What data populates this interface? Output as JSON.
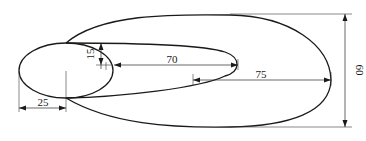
{
  "diagram": {
    "type": "technical-drawing",
    "colors": {
      "line": "#1a1a1a",
      "background": "#ffffff"
    },
    "dimensions": {
      "overall_height": "60",
      "outer_offset": "75",
      "inner_length": "70",
      "inner_offset": "15",
      "small_radius": "25"
    }
  }
}
